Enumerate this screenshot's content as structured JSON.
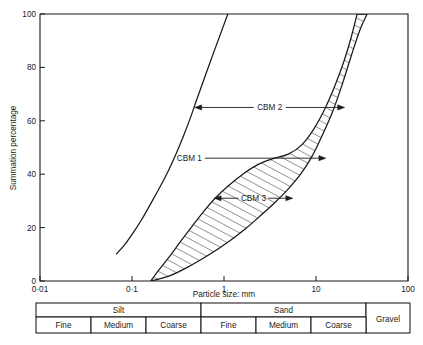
{
  "chart_data": {
    "type": "line",
    "title": "",
    "xlabel": "Particle size: mm",
    "ylabel": "Summation percentage",
    "xscale": "log",
    "xlim": [
      0.01,
      100
    ],
    "ylim": [
      0,
      100
    ],
    "grid": false,
    "legend_position": "inline-annotations",
    "xticks": [
      {
        "value": 0.01,
        "label": "0·01"
      },
      {
        "value": 0.1,
        "label": "0·1"
      },
      {
        "value": 1,
        "label": "1"
      },
      {
        "value": 10,
        "label": "10"
      },
      {
        "value": 100,
        "label": "100"
      }
    ],
    "yticks": [
      {
        "value": 0,
        "label": "0"
      },
      {
        "value": 20,
        "label": "20"
      },
      {
        "value": 40,
        "label": "40"
      },
      {
        "value": 60,
        "label": "60"
      },
      {
        "value": 80,
        "label": "80"
      },
      {
        "value": 100,
        "label": "100"
      }
    ],
    "series": [
      {
        "name": "CBM 2",
        "style": "single-curve",
        "points": [
          {
            "x": 0.068,
            "y": 10.2
          },
          {
            "x": 0.085,
            "y": 14.0
          },
          {
            "x": 0.105,
            "y": 18.5
          },
          {
            "x": 0.13,
            "y": 23.5
          },
          {
            "x": 0.16,
            "y": 29.0
          },
          {
            "x": 0.2,
            "y": 35.0
          },
          {
            "x": 0.25,
            "y": 41.5
          },
          {
            "x": 0.3,
            "y": 47.5
          },
          {
            "x": 0.36,
            "y": 54.0
          },
          {
            "x": 0.43,
            "y": 61.0
          },
          {
            "x": 0.5,
            "y": 67.5
          },
          {
            "x": 0.62,
            "y": 76.5
          },
          {
            "x": 0.78,
            "y": 86.0
          },
          {
            "x": 0.95,
            "y": 94.0
          },
          {
            "x": 1.1,
            "y": 100.0
          }
        ]
      },
      {
        "name": "CBM 1 / CBM 3 envelope",
        "style": "hatched-band",
        "upper_points": [
          {
            "x": 0.16,
            "y": 0.0
          },
          {
            "x": 0.2,
            "y": 4.5
          },
          {
            "x": 0.26,
            "y": 9.5
          },
          {
            "x": 0.34,
            "y": 15.0
          },
          {
            "x": 0.45,
            "y": 20.5
          },
          {
            "x": 0.6,
            "y": 26.0
          },
          {
            "x": 0.8,
            "y": 31.0
          },
          {
            "x": 1.1,
            "y": 35.5
          },
          {
            "x": 1.6,
            "y": 40.0
          },
          {
            "x": 2.3,
            "y": 43.5
          },
          {
            "x": 3.4,
            "y": 45.8
          },
          {
            "x": 5.0,
            "y": 47.5
          },
          {
            "x": 7.0,
            "y": 51.0
          },
          {
            "x": 9.5,
            "y": 57.0
          },
          {
            "x": 12.5,
            "y": 64.5
          },
          {
            "x": 16.0,
            "y": 73.0
          },
          {
            "x": 20.0,
            "y": 82.0
          },
          {
            "x": 24.0,
            "y": 91.0
          },
          {
            "x": 28.0,
            "y": 100.0
          }
        ],
        "lower_points": [
          {
            "x": 0.16,
            "y": 0.0
          },
          {
            "x": 0.26,
            "y": 2.0
          },
          {
            "x": 0.42,
            "y": 5.5
          },
          {
            "x": 0.7,
            "y": 10.0
          },
          {
            "x": 1.1,
            "y": 14.5
          },
          {
            "x": 1.7,
            "y": 19.5
          },
          {
            "x": 2.5,
            "y": 24.5
          },
          {
            "x": 3.6,
            "y": 29.5
          },
          {
            "x": 5.0,
            "y": 34.5
          },
          {
            "x": 6.8,
            "y": 40.0
          },
          {
            "x": 9.0,
            "y": 46.5
          },
          {
            "x": 11.5,
            "y": 54.0
          },
          {
            "x": 15.0,
            "y": 63.0
          },
          {
            "x": 19.0,
            "y": 73.0
          },
          {
            "x": 24.0,
            "y": 84.0
          },
          {
            "x": 30.0,
            "y": 94.0
          },
          {
            "x": 36.0,
            "y": 100.0
          }
        ]
      }
    ],
    "annotations": [
      {
        "label": "CBM 2",
        "y": 65,
        "arrow": "double",
        "from_x": 0.48,
        "to_x": 20.5
      },
      {
        "label": "CBM 1",
        "y": 46,
        "arrow": "right",
        "from_x": 0.62,
        "to_x": 12.8
      },
      {
        "label": "CBM 3",
        "y": 31,
        "arrow": "double",
        "from_x": 0.78,
        "to_x": 5.6
      }
    ]
  },
  "axes": {
    "ylabel": "Summation percentage",
    "xlabel": "Particle size: mm",
    "xtick_labels": [
      "0·01",
      "0·1",
      "1",
      "10",
      "100"
    ],
    "ytick_labels": [
      "0",
      "20",
      "40",
      "60",
      "80",
      "100"
    ]
  },
  "annotations": {
    "cbm2": "CBM 2",
    "cbm1": "CBM 1",
    "cbm3": "CBM 3"
  },
  "classification_table": {
    "top_row": [
      {
        "label": "Silt",
        "span": 3
      },
      {
        "label": "Sand",
        "span": 3
      },
      {
        "label": "Gravel",
        "span": 1,
        "rowspan": 2
      }
    ],
    "bottom_row": [
      {
        "label": "Fine"
      },
      {
        "label": "Medium"
      },
      {
        "label": "Coarse"
      },
      {
        "label": "Fine"
      },
      {
        "label": "Medium"
      },
      {
        "label": "Coarse"
      }
    ],
    "silt_label": "Silt",
    "sand_label": "Sand",
    "gravel_label": "Gravel",
    "fine_label_1": "Fine",
    "medium_label_1": "Medium",
    "coarse_label_1": "Coarse",
    "fine_label_2": "Fine",
    "medium_label_2": "Medium",
    "coarse_label_2": "Coarse"
  },
  "colors": {
    "ink": "#1a1a1a",
    "background": "#ffffff"
  }
}
